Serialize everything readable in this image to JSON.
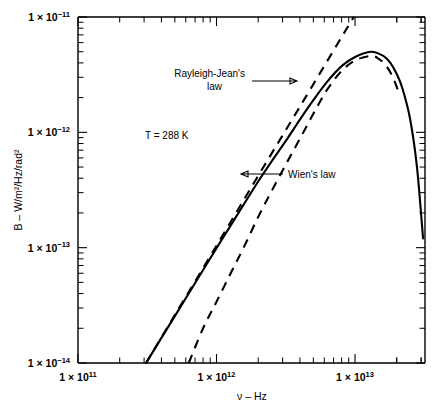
{
  "figure": {
    "background": "#ffffff",
    "ink": "#000000"
  },
  "axes": {
    "x": {
      "label": "ν – Hz",
      "scale": "log",
      "range": [
        100000000000.0,
        32000000000000.0
      ],
      "ticks": [
        {
          "value": 100000000000.0,
          "mantissa": "1",
          "base": "10",
          "exponent": "11",
          "text": "1 × 10¹¹"
        },
        {
          "value": 1000000000000.0,
          "mantissa": "1",
          "base": "10",
          "exponent": "12",
          "text": "1 × 10¹²"
        },
        {
          "value": 10000000000000.0,
          "mantissa": "1",
          "base": "10",
          "exponent": "13",
          "text": "1 × 10¹³"
        }
      ]
    },
    "y": {
      "label": "B – W/m²/Hz/rad²",
      "scale": "log",
      "range": [
        1e-14,
        1e-11
      ],
      "ticks": [
        {
          "value": 1e-11,
          "mantissa": "1",
          "base": "10",
          "exponent": "−11",
          "text": "1 × 10⁻¹¹"
        },
        {
          "value": 1e-12,
          "mantissa": "1",
          "base": "10",
          "exponent": "−12",
          "text": "1 × 10⁻¹²"
        },
        {
          "value": 1e-13,
          "mantissa": "1",
          "base": "10",
          "exponent": "−13",
          "text": "1 × 10⁻¹³"
        },
        {
          "value": 1e-14,
          "mantissa": "1",
          "base": "10",
          "exponent": "−14",
          "text": "1 × 10⁻¹⁴"
        }
      ]
    }
  },
  "annotations": {
    "temperature": "T = 288 K",
    "rayleigh": "Rayleigh-Jean's\nlaw",
    "rayleigh_line1": "Rayleigh-Jean's",
    "rayleigh_line2": "law",
    "wien": "Wien's law"
  },
  "chart_data": {
    "type": "line",
    "title": "",
    "subtitle": "",
    "xlabel": "ν – Hz",
    "ylabel": "B – W/m²/Hz/rad²",
    "xscale": "log",
    "yscale": "log",
    "xlim": [
      100000000000.0,
      32000000000000.0
    ],
    "ylim": [
      1e-14,
      1e-11
    ],
    "grid": false,
    "legend": "annotations-inline",
    "temperature_K": 288,
    "annotations": [
      {
        "text": "T = 288 K",
        "x": 380000000000.0,
        "y": 1e-12
      },
      {
        "text": "Rayleigh-Jean's law",
        "x": 420000000000.0,
        "y": 3.6e-12,
        "arrow_to": [
          3300000000000.0,
          3200000000000.0
        ]
      },
      {
        "text": "Wien's law",
        "x": 5600000000000.0,
        "y": 4.6e-13,
        "arrow_to": [
          3000000000000.0,
          4.6e-13
        ]
      }
    ],
    "series": [
      {
        "name": "Planck's law",
        "style": "solid",
        "x": [
          310000000000.0,
          400000000000.0,
          500000000000.0,
          630000000000.0,
          800000000000.0,
          1000000000000.0,
          1300000000000.0,
          1600000000000.0,
          2000000000000.0,
          2500000000000.0,
          3200000000000.0,
          4000000000000.0,
          5000000000000.0,
          6300000000000.0,
          8000000000000.0,
          10000000000000.0,
          13000000000000.0,
          16000000000000.0,
          18000000000000.0,
          20000000000000.0,
          22000000000000.0,
          25000000000000.0,
          28000000000000.0,
          31000000000000.0
        ],
        "y": [
          1e-14,
          1.65e-14,
          2.55e-14,
          4e-14,
          6.4e-14,
          9.9e-14,
          1.64e-13,
          2.45e-13,
          3.75e-13,
          5.6e-13,
          8.6e-13,
          1.29e-12,
          1.9e-12,
          2.75e-12,
          3.75e-12,
          4.5e-12,
          5e-12,
          4.6e-12,
          4e-12,
          3.2e-12,
          2.4e-12,
          1.3e-12,
          5e-13,
          1.2e-13
        ]
      },
      {
        "name": "Rayleigh-Jean's law",
        "style": "dashed",
        "x": [
          310000000000.0,
          500000000000.0,
          1000000000000.0,
          2000000000000.0,
          4000000000000.0,
          8000000000000.0,
          12000000000000.0
        ],
        "y": [
          1e-14,
          2.6e-14,
          1.04e-13,
          4.2e-13,
          1.67e-12,
          6.7e-12,
          1.5e-11
        ]
      },
      {
        "name": "Wien's law",
        "style": "dashed",
        "x": [
          630000000000.0,
          800000000000.0,
          1000000000000.0,
          1300000000000.0,
          1600000000000.0,
          2000000000000.0,
          2500000000000.0,
          3200000000000.0,
          4000000000000.0,
          5000000000000.0,
          6300000000000.0,
          8000000000000.0,
          10000000000000.0,
          13000000000000.0,
          15000000000000.0,
          17000000000000.0,
          19000000000000.0,
          21000000000000.0
        ],
        "y": [
          1e-14,
          2e-14,
          3.4e-14,
          6.4e-14,
          1.05e-13,
          1.85e-13,
          3.1e-13,
          5.4e-13,
          8.8e-13,
          1.45e-12,
          2.35e-12,
          3.4e-12,
          4.2e-12,
          4.6e-12,
          4.3e-12,
          3.7e-12,
          2.9e-12,
          2.1e-12
        ]
      }
    ]
  }
}
